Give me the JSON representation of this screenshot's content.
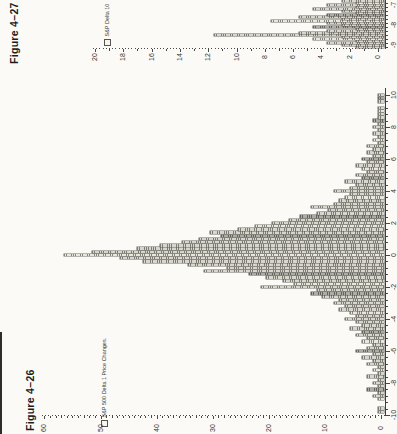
{
  "page": {
    "figure_27_caption": "Figure 4–27",
    "figure_26_caption": "Figure 4–26"
  },
  "colors": {
    "paper": "#fbfaf7",
    "ink": "#2e2d29",
    "axis": "#3f3e3a",
    "bar_hatch": "#7d7c75",
    "bar_fill": "#d8d6cc",
    "bar_outline": "#57564f",
    "page_edge": "#2e2d2a"
  },
  "chart_data": [
    {
      "id": "fig426",
      "type": "bar",
      "title": "Figure 4–26",
      "legend": "S&P 500 Delta 1 Price Changes.",
      "orientation": "page rotated 90° CCW; bars drawn horizontally, values increase to the left",
      "x_axis": {
        "min": -10,
        "max": 10,
        "tick_labels": [
          -10,
          -8,
          -6,
          -4,
          -2,
          0,
          2,
          4,
          6,
          8,
          10
        ],
        "minor_step": 0.4
      },
      "y_axis": {
        "min": 0,
        "max": 60,
        "tick_labels": [
          0,
          10,
          20,
          30,
          40,
          50,
          60
        ],
        "minor_step": 1
      },
      "bin_start": -10.0,
      "bin_step": 0.2,
      "values": [
        0,
        1,
        1,
        0,
        0,
        1,
        2,
        1,
        3,
        1,
        2,
        1,
        3,
        1,
        2,
        1,
        3,
        2,
        4,
        2,
        5,
        3,
        2,
        4,
        3,
        5,
        4,
        6,
        4,
        5,
        7,
        5,
        6,
        8,
        7,
        9,
        8,
        11,
        13,
        12,
        22,
        16,
        18,
        21,
        24,
        32,
        28,
        35,
        43,
        47,
        57,
        52,
        44,
        40,
        36,
        33,
        29,
        31,
        26,
        23,
        20,
        17,
        15,
        12,
        10,
        13,
        9,
        8,
        7,
        6,
        9,
        6,
        5,
        7,
        4,
        5,
        3,
        4,
        5,
        3,
        4,
        2,
        3,
        2,
        3,
        1,
        2,
        1,
        2,
        1,
        2,
        1,
        2,
        1,
        1,
        1,
        1,
        0,
        1,
        1,
        1
      ]
    },
    {
      "id": "fig427",
      "type": "bar",
      "title": "Figure 4–27",
      "legend": "S&P Delta 10",
      "legend_truncated": true,
      "note": "chart cropped by page edge; only left tail from -9.1 to -6.8 visible",
      "x_axis": {
        "visible_min": -9.15,
        "visible_max": -6.75,
        "tick_labels": [
          -9,
          -8,
          -7
        ],
        "minor_step": 0.2
      },
      "y_axis": {
        "min": 0,
        "max": 20,
        "tick_labels": [
          0,
          2,
          4,
          6,
          8,
          10,
          12,
          14,
          16,
          18,
          20
        ],
        "minor_step": 1
      },
      "bin_start": -9.1,
      "bin_step": 0.1,
      "values": [
        2,
        3,
        4,
        2,
        5,
        3,
        12,
        6,
        4,
        2,
        5,
        3,
        4,
        8,
        3,
        6,
        4,
        2,
        3,
        5,
        2,
        4,
        2,
        3
      ]
    }
  ]
}
